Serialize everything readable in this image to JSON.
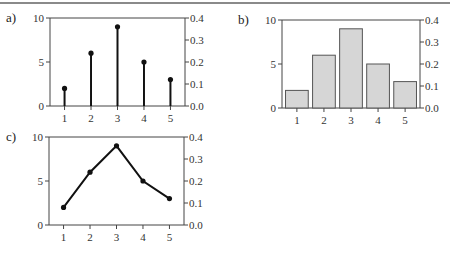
{
  "chart_data": [
    {
      "panel": "a)",
      "type": "stem",
      "categories": [
        "1",
        "2",
        "3",
        "4",
        "5"
      ],
      "values": [
        2,
        6,
        9,
        5,
        3
      ],
      "left_axis": {
        "ticks": [
          "0",
          "5",
          "10"
        ],
        "range": [
          0,
          10
        ]
      },
      "right_axis": {
        "ticks": [
          "0.0",
          "0.1",
          "0.2",
          "0.3",
          "0.4"
        ],
        "range": [
          0,
          0.4
        ]
      },
      "grid": false
    },
    {
      "panel": "b)",
      "type": "bar",
      "categories": [
        "1",
        "2",
        "3",
        "4",
        "5"
      ],
      "values": [
        2,
        6,
        9,
        5,
        3
      ],
      "left_axis": {
        "ticks": [
          "0",
          "5",
          "10"
        ],
        "range": [
          0,
          10
        ]
      },
      "right_axis": {
        "ticks": [
          "0.0",
          "0.1",
          "0.2",
          "0.3",
          "0.4"
        ],
        "range": [
          0,
          0.4
        ]
      },
      "bar_color": "#d6d6d6",
      "grid": false
    },
    {
      "panel": "c)",
      "type": "line",
      "categories": [
        "1",
        "2",
        "3",
        "4",
        "5"
      ],
      "values": [
        2,
        6,
        9,
        5,
        3
      ],
      "left_axis": {
        "ticks": [
          "0",
          "5",
          "10"
        ],
        "range": [
          0,
          10
        ]
      },
      "right_axis": {
        "ticks": [
          "0.0",
          "0.1",
          "0.2",
          "0.3",
          "0.4"
        ],
        "range": [
          0,
          0.4
        ]
      },
      "grid": false
    }
  ],
  "labels": {
    "a": "a)",
    "b": "b)",
    "c": "c)"
  }
}
